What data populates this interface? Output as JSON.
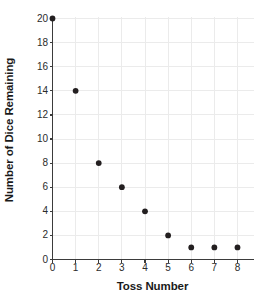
{
  "chart_data": {
    "type": "scatter",
    "title": "",
    "xlabel": "Toss Number",
    "ylabel": "Number of Dice Remaining",
    "x": [
      0,
      1,
      2,
      3,
      4,
      5,
      6,
      7,
      8
    ],
    "values": [
      20,
      14,
      8,
      6,
      4,
      2,
      1,
      1,
      1
    ],
    "series": [
      {
        "name": "Dice Remaining",
        "points": [
          {
            "x": 0,
            "y": 20
          },
          {
            "x": 1,
            "y": 14
          },
          {
            "x": 2,
            "y": 8
          },
          {
            "x": 3,
            "y": 6
          },
          {
            "x": 4,
            "y": 4
          },
          {
            "x": 5,
            "y": 2
          },
          {
            "x": 6,
            "y": 1
          },
          {
            "x": 7,
            "y": 1
          },
          {
            "x": 8,
            "y": 1
          }
        ]
      }
    ],
    "xlim": [
      0,
      8.6
    ],
    "ylim": [
      0,
      20.6
    ],
    "xticks": [
      0,
      1,
      2,
      3,
      4,
      5,
      6,
      7,
      8
    ],
    "yticks": [
      0,
      2,
      4,
      6,
      8,
      10,
      12,
      14,
      16,
      18,
      20
    ],
    "xtick_labels": [
      "0",
      "1",
      "2",
      "3",
      "4",
      "5",
      "6",
      "7",
      "8"
    ],
    "ytick_labels": [
      "0",
      "2",
      "4",
      "6",
      "8",
      "10",
      "12",
      "14",
      "16",
      "18",
      "20"
    ],
    "grid": true,
    "legend": false,
    "marker_color": "#231f20",
    "grid_color": "#ebebeb",
    "axis_color": "#3b3b3b",
    "text_color": "#1a1a1a"
  }
}
